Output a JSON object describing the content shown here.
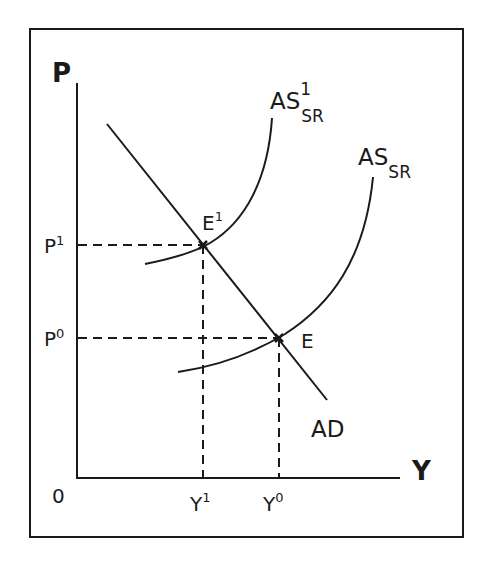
{
  "diagram": {
    "type": "AS-AD shift diagram",
    "axes": {
      "y_label": "P",
      "x_label": "Y",
      "origin_label": "0"
    },
    "price_levels": [
      {
        "base": "P",
        "sup": "1",
        "label": "P1"
      },
      {
        "base": "P",
        "sup": "0",
        "label": "P0"
      }
    ],
    "output_levels": [
      {
        "base": "Y",
        "sup": "1",
        "label": "Y1"
      },
      {
        "base": "Y",
        "sup": "0",
        "label": "Y0"
      }
    ],
    "curves": {
      "as_sr_shifted": {
        "base": "AS",
        "sub": "SR",
        "sup": "1"
      },
      "as_sr": {
        "base": "AS",
        "sub": "SR"
      },
      "ad": {
        "label": "AD"
      }
    },
    "equilibria": [
      {
        "base": "E",
        "sup": "1",
        "label": "E1",
        "price": "P1",
        "output": "Y1"
      },
      {
        "base": "E",
        "sup": "",
        "label": "E",
        "price": "P0",
        "output": "Y0"
      }
    ],
    "colors": {
      "line": "#1a1a1a",
      "background": "#ffffff"
    }
  }
}
